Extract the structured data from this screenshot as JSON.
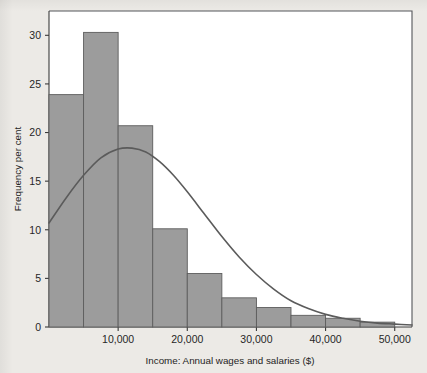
{
  "figure": {
    "background_color": "#eceae6",
    "plot_background_color": "#ffffff",
    "bar_fill_color": "#9c9c9c",
    "bar_edge_color": "#5d5d5d",
    "curve_color": "#5b5b5b"
  },
  "chart_data": {
    "type": "bar",
    "title": "",
    "subtitle": "",
    "xlabel": "Income: Annual wages and salaries ($)",
    "ylabel": "Frequency per cent",
    "xlim": [
      0,
      52500
    ],
    "ylim": [
      0,
      32.5
    ],
    "grid": false,
    "legend": null,
    "bin_width": 5000,
    "categories": [
      "0-5,000",
      "5,000-10,000",
      "10,000-15,000",
      "15,000-20,000",
      "20,000-25,000",
      "25,000-30,000",
      "30,000-35,000",
      "35,000-40,000",
      "40,000-45,000",
      "45,000-50,000"
    ],
    "bin_edges": [
      0,
      5000,
      10000,
      15000,
      20000,
      25000,
      30000,
      35000,
      40000,
      45000,
      50000
    ],
    "values": [
      23.9,
      30.3,
      20.7,
      10.1,
      5.5,
      3.0,
      2.0,
      1.2,
      0.9,
      0.5
    ],
    "xticks": [
      10000,
      20000,
      30000,
      40000,
      50000
    ],
    "xticklabels": [
      "10,000",
      "20,000",
      "30,000",
      "40,000",
      "50,000"
    ],
    "yticks": [
      0,
      5,
      10,
      15,
      20,
      25,
      30
    ],
    "yticklabels": [
      "0",
      "5",
      "10",
      "15",
      "20",
      "25",
      "30"
    ],
    "series": [
      {
        "name": "Frequency per cent",
        "type": "bar",
        "values": [
          23.9,
          30.3,
          20.7,
          10.1,
          5.5,
          3.0,
          2.0,
          1.2,
          0.9,
          0.5
        ]
      },
      {
        "name": "Fitted normal curve",
        "type": "line",
        "x": [
          0,
          2500,
          5000,
          7500,
          10000,
          12000,
          14000,
          16000,
          18000,
          20000,
          22500,
          25000,
          27500,
          30000,
          32500,
          35000,
          37500,
          40000,
          42500,
          45000,
          47500,
          50000,
          52500
        ],
        "y": [
          10.7,
          13.3,
          15.6,
          17.4,
          18.3,
          18.4,
          18.0,
          17.0,
          15.6,
          13.9,
          11.6,
          9.3,
          7.2,
          5.4,
          3.9,
          2.7,
          1.9,
          1.3,
          0.9,
          0.6,
          0.4,
          0.3,
          0.2
        ]
      }
    ]
  }
}
